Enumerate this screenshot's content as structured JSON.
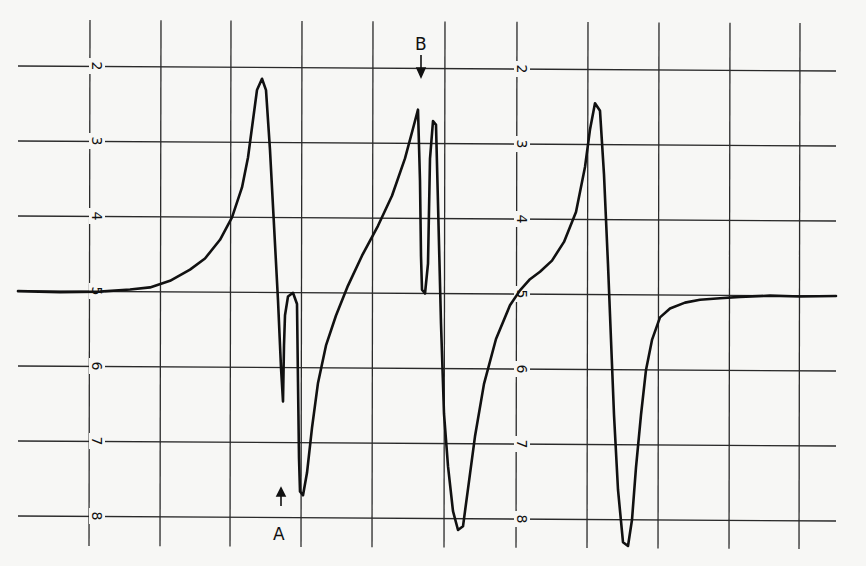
{
  "chart_data": {
    "type": "line",
    "title": "",
    "xlabel": "",
    "ylabel": "",
    "grid": true,
    "legend": null,
    "y_tick_labels_left": [
      "2",
      "3",
      "4",
      "5",
      "6",
      "7",
      "8"
    ],
    "y_tick_labels_right": [
      "2",
      "3",
      "4",
      "5",
      "6",
      "7",
      "8"
    ],
    "y_ticks_px": [
      66,
      141,
      216,
      291,
      366,
      441,
      516
    ],
    "x_gridlines_px": [
      90,
      161,
      231,
      302,
      373,
      445,
      517,
      588,
      659,
      730,
      800
    ],
    "baseline_level": 5,
    "ylim": [
      1.5,
      8.6
    ],
    "annotations": [
      {
        "label": "A",
        "arrow": "up",
        "x_px": 281,
        "y_px": 490
      },
      {
        "label": "B",
        "arrow": "down",
        "x_px": 421,
        "y_px": 62
      }
    ],
    "series": [
      {
        "name": "spectrum",
        "points": [
          [
            18,
            5.0
          ],
          [
            60,
            5.01
          ],
          [
            100,
            5.0
          ],
          [
            130,
            4.97
          ],
          [
            150,
            4.94
          ],
          [
            170,
            4.85
          ],
          [
            190,
            4.7
          ],
          [
            205,
            4.55
          ],
          [
            220,
            4.3
          ],
          [
            232,
            4.0
          ],
          [
            242,
            3.6
          ],
          [
            248,
            3.2
          ],
          [
            253,
            2.7
          ],
          [
            257,
            2.3
          ],
          [
            262,
            2.15
          ],
          [
            266,
            2.3
          ],
          [
            270,
            3.1
          ],
          [
            274,
            4.1
          ],
          [
            278,
            5.1
          ],
          [
            281,
            6.0
          ],
          [
            283,
            6.45
          ],
          [
            284,
            5.7
          ],
          [
            285,
            5.3
          ],
          [
            288,
            5.05
          ],
          [
            293,
            5.0
          ],
          [
            297,
            5.15
          ],
          [
            298,
            6.2
          ],
          [
            299,
            7.2
          ],
          [
            300,
            7.65
          ],
          [
            303,
            7.7
          ],
          [
            307,
            7.4
          ],
          [
            312,
            6.8
          ],
          [
            318,
            6.2
          ],
          [
            326,
            5.7
          ],
          [
            336,
            5.3
          ],
          [
            348,
            4.9
          ],
          [
            362,
            4.5
          ],
          [
            378,
            4.1
          ],
          [
            392,
            3.7
          ],
          [
            405,
            3.2
          ],
          [
            413,
            2.8
          ],
          [
            418,
            2.55
          ],
          [
            420,
            3.5
          ],
          [
            421,
            4.5
          ],
          [
            422,
            4.95
          ],
          [
            425,
            5.0
          ],
          [
            428,
            4.6
          ],
          [
            430,
            3.2
          ],
          [
            433,
            2.7
          ],
          [
            436,
            2.75
          ],
          [
            438,
            3.8
          ],
          [
            441,
            5.4
          ],
          [
            444,
            6.6
          ],
          [
            448,
            7.3
          ],
          [
            453,
            7.9
          ],
          [
            458,
            8.15
          ],
          [
            463,
            8.1
          ],
          [
            468,
            7.6
          ],
          [
            475,
            6.9
          ],
          [
            484,
            6.2
          ],
          [
            496,
            5.6
          ],
          [
            510,
            5.15
          ],
          [
            520,
            4.95
          ],
          [
            530,
            4.8
          ],
          [
            540,
            4.7
          ],
          [
            552,
            4.55
          ],
          [
            564,
            4.3
          ],
          [
            576,
            3.9
          ],
          [
            585,
            3.3
          ],
          [
            590,
            2.8
          ],
          [
            595,
            2.45
          ],
          [
            600,
            2.55
          ],
          [
            604,
            3.4
          ],
          [
            608,
            4.6
          ],
          [
            611,
            5.6
          ],
          [
            614,
            6.6
          ],
          [
            618,
            7.6
          ],
          [
            623,
            8.3
          ],
          [
            628,
            8.35
          ],
          [
            632,
            8.0
          ],
          [
            636,
            7.3
          ],
          [
            641,
            6.6
          ],
          [
            646,
            6.0
          ],
          [
            652,
            5.6
          ],
          [
            660,
            5.3
          ],
          [
            670,
            5.18
          ],
          [
            685,
            5.1
          ],
          [
            700,
            5.06
          ],
          [
            720,
            5.04
          ],
          [
            740,
            5.02
          ],
          [
            770,
            5.0
          ],
          [
            800,
            5.01
          ],
          [
            836,
            5.0
          ]
        ]
      }
    ]
  },
  "labels": {
    "marker_a": "A",
    "marker_b": "B"
  }
}
